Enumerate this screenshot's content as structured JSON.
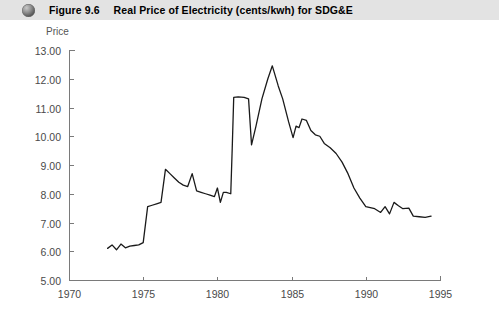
{
  "header": {
    "icon": "sphere-bullet-icon",
    "figure_number": "Figure 9.6",
    "title": "Real Price of Electricity (cents/kwh) for SDG&E",
    "background_color": "#e3e3e3",
    "text_color": "#000000"
  },
  "chart_data": {
    "type": "line",
    "title": "Real Price of Electricity (cents/kwh) for SDG&E",
    "xlabel": "",
    "ylabel": "Price",
    "xlim": [
      1970,
      1995
    ],
    "ylim": [
      5.0,
      13.0
    ],
    "grid": false,
    "legend": null,
    "x_tick_labels": [
      "1970",
      "1975",
      "1980",
      "1985",
      "1990",
      "1995"
    ],
    "x_ticks": [
      1970,
      1975,
      1980,
      1985,
      1990,
      1995
    ],
    "y_tick_labels": [
      "5.00",
      "6.00",
      "7.00",
      "8.00",
      "9.00",
      "10.00",
      "11.00",
      "12.00",
      "13.00"
    ],
    "y_ticks": [
      5.0,
      6.0,
      7.0,
      8.0,
      9.0,
      10.0,
      11.0,
      12.0,
      13.0
    ],
    "series": [
      {
        "name": "Real Price of Electricity (cents/kwh)",
        "color": "#1a1a1a",
        "x": [
          1972.6,
          1972.9,
          1973.2,
          1973.5,
          1973.8,
          1974.1,
          1974.4,
          1974.7,
          1975.0,
          1975.3,
          1975.6,
          1975.9,
          1976.2,
          1976.5,
          1976.8,
          1977.1,
          1977.4,
          1977.7,
          1978.0,
          1978.3,
          1978.6,
          1978.9,
          1979.2,
          1979.5,
          1979.8,
          1980.0,
          1980.2,
          1980.4,
          1980.6,
          1980.9,
          1981.0,
          1981.1,
          1981.4,
          1981.8,
          1982.1,
          1982.3,
          1982.6,
          1983.0,
          1983.4,
          1983.7,
          1983.9,
          1984.1,
          1984.4,
          1984.8,
          1985.1,
          1985.3,
          1985.5,
          1985.7,
          1986.0,
          1986.3,
          1986.6,
          1986.9,
          1987.2,
          1987.6,
          1988.0,
          1988.4,
          1988.8,
          1989.2,
          1989.6,
          1990.0,
          1990.3,
          1990.6,
          1991.0,
          1991.3,
          1991.6,
          1991.9,
          1992.2,
          1992.5,
          1992.9,
          1993.2,
          1993.6,
          1994.0,
          1994.4
        ],
        "y": [
          6.1,
          6.22,
          6.05,
          6.25,
          6.12,
          6.18,
          6.2,
          6.22,
          6.3,
          7.55,
          7.6,
          7.65,
          7.7,
          8.85,
          8.7,
          8.55,
          8.4,
          8.3,
          8.25,
          8.7,
          8.1,
          8.05,
          8.0,
          7.95,
          7.9,
          8.2,
          7.7,
          8.05,
          8.05,
          8.0,
          9.6,
          11.35,
          11.37,
          11.35,
          11.3,
          9.7,
          10.35,
          11.3,
          12.0,
          12.45,
          12.1,
          11.75,
          11.3,
          10.5,
          9.95,
          10.35,
          10.3,
          10.6,
          10.55,
          10.2,
          10.05,
          10.0,
          9.75,
          9.6,
          9.4,
          9.1,
          8.7,
          8.2,
          7.85,
          7.55,
          7.52,
          7.48,
          7.35,
          7.55,
          7.3,
          7.7,
          7.58,
          7.48,
          7.5,
          7.22,
          7.2,
          7.18,
          7.22
        ]
      }
    ]
  },
  "plot_geometry": {
    "left_px": 69,
    "right_px": 440,
    "top_px": 30,
    "bottom_px": 260
  }
}
